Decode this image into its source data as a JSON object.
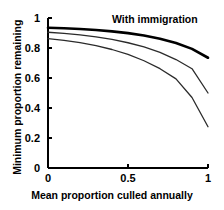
{
  "chart_data": {
    "type": "line",
    "title": "",
    "subtitle": "",
    "xlabel": "Mean proportion culled annually",
    "ylabel": "Minimum proportion remaining",
    "xlim": [
      0,
      1
    ],
    "ylim": [
      0,
      1
    ],
    "grid": false,
    "legend_position": "none",
    "xticks": [
      "0",
      "0.5",
      "1"
    ],
    "xtick_values": [
      0,
      0.5,
      1
    ],
    "yticks": [
      "0",
      "0.2",
      "0.4",
      "0.6",
      "0.8",
      "1"
    ],
    "ytick_values": [
      0,
      0.2,
      0.4,
      0.6,
      0.8,
      1
    ],
    "annotations": [
      {
        "text": "With immigration",
        "x": 0.72,
        "y": 0.96
      }
    ],
    "x": [
      0,
      0.1,
      0.2,
      0.3,
      0.4,
      0.5,
      0.6,
      0.7,
      0.8,
      0.9,
      1
    ],
    "series": [
      {
        "name": "With immigration",
        "emphasis": "bold",
        "color": "#000000",
        "linewidth": 2.6,
        "values": [
          0.935,
          0.932,
          0.927,
          0.92,
          0.911,
          0.899,
          0.883,
          0.862,
          0.833,
          0.794,
          0.735
        ]
      },
      {
        "name": "Intermediate immigration",
        "emphasis": "normal",
        "color": "#2b2b2b",
        "linewidth": 1.3,
        "values": [
          0.905,
          0.898,
          0.888,
          0.874,
          0.857,
          0.835,
          0.807,
          0.771,
          0.723,
          0.662,
          0.5
        ]
      },
      {
        "name": "No immigration",
        "emphasis": "normal",
        "color": "#2b2b2b",
        "linewidth": 1.3,
        "values": [
          0.862,
          0.851,
          0.836,
          0.816,
          0.79,
          0.757,
          0.715,
          0.662,
          0.594,
          0.47,
          0.275
        ]
      }
    ]
  }
}
